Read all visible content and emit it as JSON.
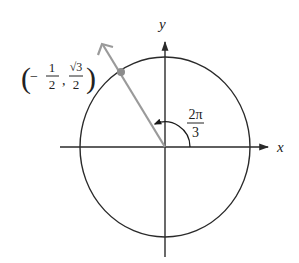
{
  "diagram": {
    "type": "unit-circle",
    "axes": {
      "x_label": "x",
      "y_label": "y"
    },
    "angle": {
      "numerator": "2π",
      "denominator": "3",
      "radians": 2.0944
    },
    "point": {
      "x_numerator": "1",
      "x_denominator": "2",
      "x_sign": "−",
      "y_numerator": "√3",
      "y_denominator": "2",
      "open_paren": "(",
      "close_paren": ")",
      "comma": ","
    },
    "colors": {
      "axis": "#2a2a2a",
      "circle": "#2a2a2a",
      "terminal_ray": "#9a9a9a",
      "point_dot": "#8c8c8c",
      "text": "#222222"
    }
  }
}
